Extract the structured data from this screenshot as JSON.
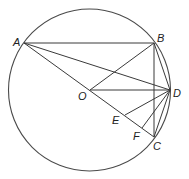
{
  "diagram": {
    "points": [
      {
        "id": "A",
        "label": "A"
      },
      {
        "id": "B",
        "label": "B"
      },
      {
        "id": "C",
        "label": "C"
      },
      {
        "id": "D",
        "label": "D"
      },
      {
        "id": "O",
        "label": "O"
      },
      {
        "id": "E",
        "label": "E"
      },
      {
        "id": "F",
        "label": "F"
      }
    ],
    "circle": {
      "center": "O",
      "through": [
        "A",
        "B",
        "C",
        "D"
      ]
    },
    "segments": [
      [
        "A",
        "B"
      ],
      [
        "A",
        "C"
      ],
      [
        "A",
        "D"
      ],
      [
        "O",
        "B"
      ],
      [
        "O",
        "D"
      ],
      [
        "B",
        "C"
      ],
      [
        "B",
        "D"
      ],
      [
        "C",
        "D"
      ],
      [
        "D",
        "E"
      ],
      [
        "D",
        "F"
      ]
    ],
    "collinear": [
      [
        "A",
        "O",
        "E",
        "F",
        "C"
      ]
    ],
    "stroke_color": "#3a3a3a"
  }
}
